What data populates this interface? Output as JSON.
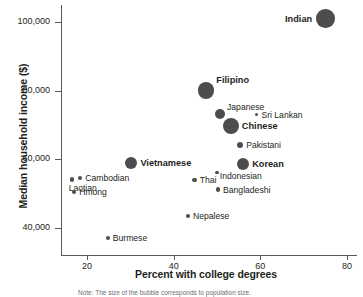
{
  "chart_data": {
    "type": "scatter",
    "title": "",
    "xlabel": "Percent with college degrees",
    "ylabel": "Median household income ($)",
    "xlim": [
      13,
      81
    ],
    "ylim": [
      33000,
      104000
    ],
    "xticks": [
      20,
      40,
      60,
      80
    ],
    "xtick_labels": [
      "20",
      "40",
      "60",
      "80"
    ],
    "yticks": [
      40000,
      60000,
      80000,
      100000
    ],
    "ytick_labels": [
      "40,000",
      "60,000",
      "80,000",
      "100,000"
    ],
    "grid": false,
    "legend": "none",
    "marker_color": "#4d4d4f",
    "note": "Note: The size of the bubble corresponds to population size.",
    "points": [
      {
        "label": "Indian",
        "x": 75,
        "y": 101000,
        "size": 9.2,
        "emphasis": "bold",
        "label_pos": "left"
      },
      {
        "label": "Filipino",
        "x": 47.5,
        "y": 80000,
        "size": 8.2,
        "emphasis": "bold",
        "label_pos": "topright"
      },
      {
        "label": "Japanese",
        "x": 50.7,
        "y": 73300,
        "size": 5.0,
        "emphasis": "normal",
        "label_pos": "topright"
      },
      {
        "label": "Sri Lankan",
        "x": 59.2,
        "y": 73000,
        "size": 1.6,
        "emphasis": "normal",
        "label_pos": "right"
      },
      {
        "label": "Chinese",
        "x": 53.2,
        "y": 69800,
        "size": 8.0,
        "emphasis": "bold",
        "label_pos": "right"
      },
      {
        "label": "Pakistani",
        "x": 55.3,
        "y": 64200,
        "size": 3.2,
        "emphasis": "normal",
        "label_pos": "right"
      },
      {
        "label": "Korean",
        "x": 56.0,
        "y": 58600,
        "size": 6.2,
        "emphasis": "bold",
        "label_pos": "right"
      },
      {
        "label": "Vietnamese",
        "x": 30.2,
        "y": 58900,
        "size": 6.2,
        "emphasis": "bold",
        "label_pos": "right"
      },
      {
        "label": "Indonesian",
        "x": 50.0,
        "y": 56200,
        "size": 1.8,
        "emphasis": "normal",
        "label_pos": "belowright"
      },
      {
        "label": "Thai",
        "x": 44.8,
        "y": 53900,
        "size": 2.2,
        "emphasis": "normal",
        "label_pos": "right"
      },
      {
        "label": "Cambodian",
        "x": 18.4,
        "y": 54500,
        "size": 2.2,
        "emphasis": "normal",
        "label_pos": "right"
      },
      {
        "label": "Laotian",
        "x": 16.5,
        "y": 54100,
        "size": 2.2,
        "emphasis": "normal",
        "label_pos": "below"
      },
      {
        "label": "Bangladeshi",
        "x": 50.2,
        "y": 51200,
        "size": 2.2,
        "emphasis": "normal",
        "label_pos": "right"
      },
      {
        "label": "Hmong",
        "x": 17.0,
        "y": 50400,
        "size": 2.2,
        "emphasis": "normal",
        "label_pos": "right"
      },
      {
        "label": "Nepalese",
        "x": 43.3,
        "y": 43500,
        "size": 2.0,
        "emphasis": "normal",
        "label_pos": "right"
      },
      {
        "label": "Burmese",
        "x": 24.8,
        "y": 37100,
        "size": 2.0,
        "emphasis": "normal",
        "label_pos": "right"
      }
    ]
  }
}
